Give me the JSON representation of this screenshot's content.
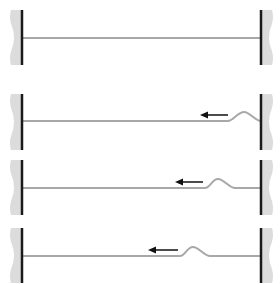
{
  "diagram": {
    "colors": {
      "rope": "#a8a8a8",
      "wall_bar": "#1a1a1a",
      "wall_fill": "#dcdcdc",
      "arrow": "#111111",
      "background": "#ffffff"
    },
    "panels": [
      {
        "id": "panel-1",
        "rope_y": 38,
        "bar_top": 10,
        "bar_bottom": 65,
        "pulse": null,
        "arrow": null
      },
      {
        "id": "panel-2",
        "rope_y": 121,
        "bar_top": 94,
        "bar_bottom": 150,
        "pulse": {
          "start_x": 228,
          "peak_x": 244,
          "end_x": 261,
          "height": 9
        },
        "arrow": {
          "from_x": 228,
          "to_x": 200,
          "y": 115,
          "direction": "left"
        }
      },
      {
        "id": "panel-3",
        "rope_y": 188,
        "bar_top": 160,
        "bar_bottom": 215,
        "pulse": {
          "start_x": 205,
          "peak_x": 218,
          "end_x": 235,
          "height": 9
        },
        "arrow": {
          "from_x": 203,
          "to_x": 175,
          "y": 182,
          "direction": "left"
        }
      },
      {
        "id": "panel-4",
        "rope_y": 256,
        "bar_top": 228,
        "bar_bottom": 283,
        "pulse": {
          "start_x": 180,
          "peak_x": 193,
          "end_x": 210,
          "height": 9
        },
        "arrow": {
          "from_x": 178,
          "to_x": 148,
          "y": 250,
          "direction": "left"
        }
      }
    ],
    "left_wall_x": 22,
    "right_wall_x": 261
  }
}
